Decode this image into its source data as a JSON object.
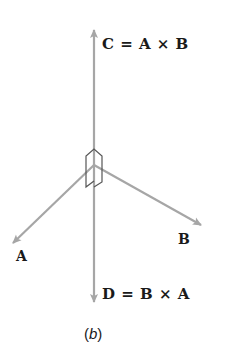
{
  "diagram": {
    "vectors": [
      {
        "id": "A",
        "label": "A"
      },
      {
        "id": "B",
        "label": "B"
      },
      {
        "id": "C",
        "label": "C = A × B"
      },
      {
        "id": "D",
        "label": "D = B × A"
      }
    ],
    "labels": {
      "c_eq": "C = A × B",
      "d_eq": "D = B × A",
      "a": "A",
      "b": "B"
    },
    "caption": {
      "open": "(",
      "letter": "b",
      "close": ")"
    },
    "colors": {
      "arrow": "#a6a6a6",
      "marker": "#555555",
      "text": "#1a1a1a"
    }
  }
}
